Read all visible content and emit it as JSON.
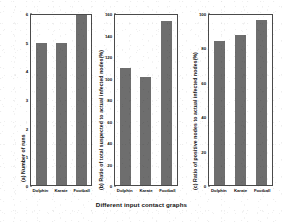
{
  "chart_data": [
    {
      "type": "bar",
      "title": "(a) Number of runs",
      "panel_id": "a",
      "categories": [
        "Dolphin",
        "Karate",
        "Football"
      ],
      "values": [
        5,
        5,
        6
      ],
      "xlabel": "Different input contact graphs",
      "ylabel": "(a) Number of runs",
      "ylim": [
        0,
        6
      ],
      "yticks": [
        0,
        1,
        2,
        3,
        4,
        5,
        6
      ],
      "ytick_labels": [
        "0",
        "1",
        "2",
        "3",
        "4",
        "5",
        "6"
      ],
      "grid": false,
      "legend": false,
      "bar_color": "#6e6e6e"
    },
    {
      "type": "bar",
      "title": "(b) Ratio of total suspected to actual infected nodes(%)",
      "panel_id": "b",
      "categories": [
        "Dolphin",
        "Karate",
        "Football"
      ],
      "values": [
        110,
        102,
        154
      ],
      "xlabel": "Different input contact graphs",
      "ylabel": "(b) Ratio of total suspected to actual infected nodes(%)",
      "ylim": [
        0,
        160
      ],
      "yticks": [
        0,
        20,
        40,
        60,
        80,
        100,
        120,
        140,
        160
      ],
      "ytick_labels": [
        "0",
        "20",
        "40",
        "60",
        "80",
        "100",
        "120",
        "140",
        "160"
      ],
      "grid": false,
      "legend": false,
      "bar_color": "#6e6e6e"
    },
    {
      "type": "bar",
      "title": "(c) Ratio of positive nodes to actual infected nodes(%)",
      "panel_id": "c",
      "categories": [
        "Dolphin",
        "Karate",
        "Football"
      ],
      "values": [
        85,
        88,
        97
      ],
      "xlabel": "Different input contact graphs",
      "ylabel": "(c) Ratio of positive nodes to actual infected nodes(%)",
      "ylim": [
        0,
        100
      ],
      "yticks": [
        0,
        20,
        40,
        60,
        80,
        100
      ],
      "ytick_labels": [
        "0",
        "20",
        "40",
        "60",
        "80",
        "100"
      ],
      "grid": false,
      "legend": false,
      "bar_color": "#6e6e6e"
    }
  ],
  "figure": {
    "shared_xlabel": "Different input contact graphs",
    "background": "#ffffff",
    "axis_color": "#4a4a4a",
    "text_color": "#111111"
  }
}
